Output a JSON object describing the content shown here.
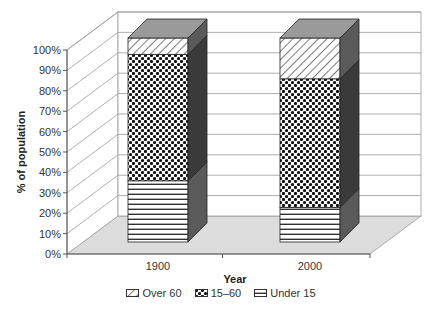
{
  "chart_data": {
    "type": "bar",
    "subtype": "stacked-100-3d",
    "title": "",
    "xlabel": "Year",
    "ylabel": "% of population",
    "categories": [
      "1900",
      "2000"
    ],
    "series": [
      {
        "name": "Under 15",
        "pattern": "horizontal-stripes",
        "values": [
          30,
          17
        ]
      },
      {
        "name": "15–60",
        "pattern": "dots",
        "values": [
          62,
          63
        ]
      },
      {
        "name": "Over 60",
        "pattern": "diagonal-hatch",
        "values": [
          8,
          20
        ]
      }
    ],
    "ylim": [
      0,
      100
    ],
    "yticks": [
      "0%",
      "10%",
      "20%",
      "30%",
      "40%",
      "50%",
      "60%",
      "70%",
      "80%",
      "90%",
      "100%"
    ],
    "grid": true,
    "legend_position": "bottom",
    "legend_order": [
      "Over 60",
      "15–60",
      "Under 15"
    ]
  },
  "colors": {
    "side_face": "#5a5a5a",
    "side_face_dark": "#3a3a3a",
    "top_face": "#9a9a9a",
    "floor": "#dcdcdc",
    "grid": "#999999"
  },
  "axis": {
    "x_title": "Year",
    "y_title": "% of population"
  },
  "legend": {
    "items": [
      {
        "label": "Over 60",
        "icon": "diagonal-hatch-swatch"
      },
      {
        "label": "15–60",
        "icon": "dots-swatch"
      },
      {
        "label": "Under 15",
        "icon": "horizontal-stripes-swatch"
      }
    ]
  }
}
